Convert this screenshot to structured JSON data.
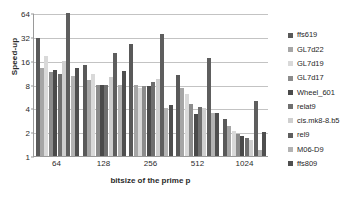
{
  "chart_data": {
    "type": "bar",
    "title": "",
    "xlabel": "bitsize of the prime p",
    "ylabel": "Speed-up",
    "yscale": "log2",
    "ylim": [
      1,
      64
    ],
    "yticks": [
      1,
      2,
      4,
      8,
      16,
      32,
      64
    ],
    "ytick_labels": [
      "1",
      "2",
      "4",
      "8",
      "16",
      "32",
      "64"
    ],
    "grid": true,
    "legend_position": "right",
    "categories": [
      "64",
      "128",
      "256",
      "512",
      "1024"
    ],
    "series": [
      {
        "name": "ffs619",
        "color": "#595959",
        "values": [
          30.5,
          14.2,
          26.0,
          10.5,
          2.9
        ]
      },
      {
        "name": "GL7d22",
        "color": "#a6a6a6",
        "values": [
          13.0,
          9.0,
          8.0,
          7.2,
          2.4
        ]
      },
      {
        "name": "GL7d19",
        "color": "#d9d9d9",
        "values": [
          18.5,
          11.0,
          7.3,
          6.0,
          2.1
        ]
      },
      {
        "name": "GL7d17",
        "color": "#8c8c8c",
        "values": [
          11.5,
          8.0,
          7.6,
          4.6,
          1.9
        ]
      },
      {
        "name": "Wheel_601",
        "color": "#4a4a4a",
        "values": [
          12.3,
          8.0,
          7.7,
          3.4,
          1.8
        ]
      },
      {
        "name": "relat9",
        "color": "#6f6f6f",
        "values": [
          11.0,
          7.9,
          8.6,
          4.2,
          1.7
        ]
      },
      {
        "name": "cis.mk8-8.b5",
        "color": "#cfcfcf",
        "values": [
          15.8,
          10.1,
          9.4,
          4.0,
          1.6
        ]
      },
      {
        "name": "rel9",
        "color": "#5e5e5e",
        "values": [
          64.0,
          20.0,
          34.5,
          17.5,
          5.0
        ]
      },
      {
        "name": "M06-D9",
        "color": "#b3b3b3",
        "values": [
          10.3,
          7.9,
          4.0,
          3.5,
          1.2
        ]
      },
      {
        "name": "ffs809",
        "color": "#4f4f4f",
        "values": [
          13.0,
          12.0,
          4.4,
          3.5,
          2.0
        ]
      }
    ]
  },
  "legend": {
    "items": [
      {
        "label": "ffs619"
      },
      {
        "label": "GL7d22"
      },
      {
        "label": "GL7d19"
      },
      {
        "label": "GL7d17"
      },
      {
        "label": "Wheel_601"
      },
      {
        "label": "relat9"
      },
      {
        "label": "cis.mk8-8.b5"
      },
      {
        "label": "rel9"
      },
      {
        "label": "M06-D9"
      },
      {
        "label": "ffs809"
      }
    ]
  }
}
